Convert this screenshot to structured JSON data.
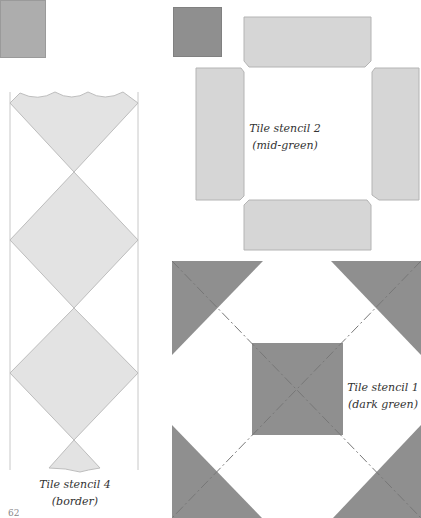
{
  "swatches": [
    {
      "id": "light",
      "color": "#adadad"
    },
    {
      "id": "dark",
      "color": "#8f8f8f"
    }
  ],
  "stencils": {
    "stencil4": {
      "title": "Tile stencil 4",
      "subtitle": "(border)",
      "fill": "#e3e3e3",
      "stroke": "#bdbdbd"
    },
    "stencil2": {
      "title": "Tile stencil 2",
      "subtitle": "(mid-green)",
      "fill": "#d6d6d6",
      "stroke": "#b4b4b4"
    },
    "stencil1": {
      "title": "Tile stencil 1",
      "subtitle": "(dark green)",
      "fill": "#8f8f8f",
      "stroke": "#7e7e7e"
    }
  },
  "page_number": "62"
}
